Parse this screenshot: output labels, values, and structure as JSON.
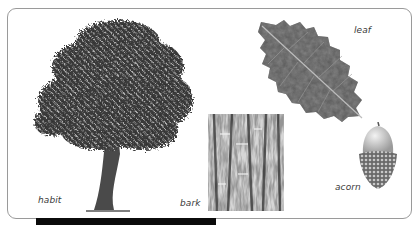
{
  "panel": {
    "labels": {
      "habit": "habit",
      "bark": "bark",
      "leaf": "leaf",
      "acorn": "acorn"
    }
  },
  "figures": [
    {
      "id": "habit",
      "icon": "tree-illustration"
    },
    {
      "id": "bark",
      "icon": "bark-texture"
    },
    {
      "id": "leaf",
      "icon": "leaf-illustration"
    },
    {
      "id": "acorn",
      "icon": "acorn-illustration"
    }
  ],
  "colors": {
    "border": "#9a9a9a",
    "label": "#3a3a3a",
    "foliage_dark": "#2a2a2a",
    "foliage_mid": "#6a6a6a",
    "bar": "#0b0b0b"
  }
}
